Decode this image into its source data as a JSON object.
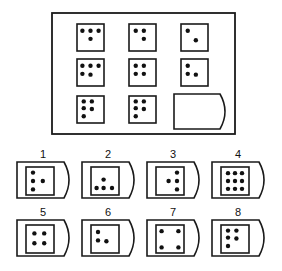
{
  "puzzle": {
    "frame": {
      "x": 52,
      "y": 13,
      "w": 183,
      "h": 121
    },
    "grid": [
      {
        "row": 0,
        "col": 0,
        "x": 77,
        "y": 24,
        "dots": [
          [
            0.2,
            0.25
          ],
          [
            0.5,
            0.25
          ],
          [
            0.8,
            0.25
          ],
          [
            0.5,
            0.55
          ]
        ]
      },
      {
        "row": 0,
        "col": 1,
        "x": 129,
        "y": 24,
        "dots": [
          [
            0.25,
            0.25
          ],
          [
            0.55,
            0.25
          ],
          [
            0.55,
            0.55
          ]
        ]
      },
      {
        "row": 0,
        "col": 2,
        "x": 181,
        "y": 24,
        "dots": [
          [
            0.25,
            0.25
          ],
          [
            0.55,
            0.6
          ]
        ]
      },
      {
        "row": 1,
        "col": 0,
        "x": 77,
        "y": 59,
        "dots": [
          [
            0.2,
            0.25
          ],
          [
            0.5,
            0.25
          ],
          [
            0.8,
            0.25
          ],
          [
            0.2,
            0.55
          ],
          [
            0.5,
            0.58
          ]
        ]
      },
      {
        "row": 1,
        "col": 1,
        "x": 129,
        "y": 59,
        "dots": [
          [
            0.25,
            0.25
          ],
          [
            0.55,
            0.25
          ],
          [
            0.25,
            0.55
          ],
          [
            0.55,
            0.55
          ]
        ]
      },
      {
        "row": 1,
        "col": 2,
        "x": 181,
        "y": 59,
        "dots": [
          [
            0.25,
            0.25
          ],
          [
            0.25,
            0.55
          ],
          [
            0.55,
            0.58
          ]
        ]
      },
      {
        "row": 2,
        "col": 0,
        "x": 77,
        "y": 96,
        "dots": [
          [
            0.25,
            0.2
          ],
          [
            0.55,
            0.2
          ],
          [
            0.25,
            0.45
          ],
          [
            0.55,
            0.48
          ],
          [
            0.25,
            0.75
          ]
        ]
      },
      {
        "row": 2,
        "col": 1,
        "x": 129,
        "y": 96,
        "dots": [
          [
            0.25,
            0.2
          ],
          [
            0.55,
            0.2
          ],
          [
            0.25,
            0.45
          ],
          [
            0.55,
            0.48
          ],
          [
            0.25,
            0.75
          ]
        ]
      }
    ],
    "missing_cell": {
      "x": 174,
      "y": 94
    }
  },
  "options": [
    {
      "label": "1",
      "x": 17,
      "y": 162,
      "dots": [
        [
          0.25,
          0.2
        ],
        [
          0.25,
          0.5
        ],
        [
          0.6,
          0.5
        ],
        [
          0.25,
          0.8
        ]
      ]
    },
    {
      "label": "2",
      "x": 82,
      "y": 162,
      "dots": [
        [
          0.45,
          0.45
        ],
        [
          0.2,
          0.75
        ],
        [
          0.45,
          0.75
        ],
        [
          0.75,
          0.75
        ]
      ]
    },
    {
      "label": "3",
      "x": 147,
      "y": 162,
      "dots": [
        [
          0.75,
          0.2
        ],
        [
          0.45,
          0.5
        ],
        [
          0.75,
          0.5
        ],
        [
          0.75,
          0.8
        ]
      ]
    },
    {
      "label": "4",
      "x": 212,
      "y": 162,
      "dots": [
        [
          0.25,
          0.22
        ],
        [
          0.5,
          0.22
        ],
        [
          0.75,
          0.22
        ],
        [
          0.25,
          0.5
        ],
        [
          0.5,
          0.5
        ],
        [
          0.75,
          0.5
        ],
        [
          0.25,
          0.78
        ],
        [
          0.5,
          0.78
        ],
        [
          0.75,
          0.78
        ]
      ]
    },
    {
      "label": "5",
      "x": 17,
      "y": 220,
      "dots": [
        [
          0.3,
          0.3
        ],
        [
          0.65,
          0.3
        ],
        [
          0.3,
          0.65
        ],
        [
          0.65,
          0.65
        ]
      ]
    },
    {
      "label": "6",
      "x": 82,
      "y": 220,
      "dots": [
        [
          0.25,
          0.25
        ],
        [
          0.25,
          0.55
        ],
        [
          0.55,
          0.58
        ]
      ]
    },
    {
      "label": "7",
      "x": 147,
      "y": 220,
      "dots": [
        [
          0.2,
          0.22
        ],
        [
          0.8,
          0.22
        ],
        [
          0.2,
          0.8
        ],
        [
          0.8,
          0.8
        ]
      ]
    },
    {
      "label": "8",
      "x": 212,
      "y": 220,
      "dots": [
        [
          0.25,
          0.2
        ],
        [
          0.55,
          0.2
        ],
        [
          0.25,
          0.45
        ],
        [
          0.55,
          0.48
        ],
        [
          0.25,
          0.75
        ]
      ]
    }
  ],
  "colors": {
    "stroke": "#1a1a1a",
    "dot": "#111111",
    "bg": "#ffffff"
  }
}
